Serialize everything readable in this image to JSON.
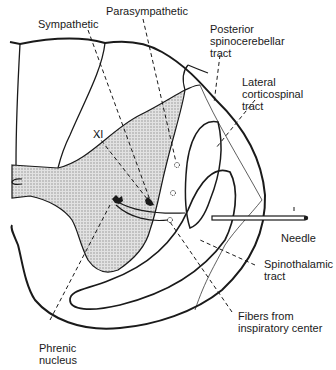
{
  "diagram": {
    "colors": {
      "line": "#1a1a1a",
      "gray_matter_fill": "#cfcfcf",
      "background": "#ffffff"
    },
    "labels": {
      "sympathetic": "Sympathetic",
      "parasympathetic": "Parasympathetic",
      "posterior_spinocerebellar": "Posterior\nspinocerebellar\ntract",
      "lateral_corticospinal": "Lateral\ncorticospinal\ntract",
      "xi": "XI",
      "needle": "Needle",
      "spinothalamic": "Spinothalamic\ntract",
      "fibers_inspiratory": "Fibers from\ninspiratory center",
      "phrenic_nucleus": "Phrenic\nnucleus"
    }
  }
}
